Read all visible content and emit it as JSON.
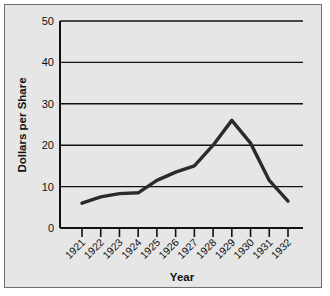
{
  "chart_data": {
    "type": "line",
    "title": "",
    "xlabel": "Year",
    "ylabel": "Dollars per Share",
    "categories": [
      "1921",
      "1922",
      "1923",
      "1924",
      "1925",
      "1926",
      "1927",
      "1928",
      "1929",
      "1930",
      "1931",
      "1932"
    ],
    "values": [
      6,
      7.5,
      8.3,
      8.5,
      11.5,
      13.5,
      15,
      20,
      26,
      20.5,
      11.5,
      6.5
    ],
    "series": [
      {
        "name": "Dollars per Share",
        "values": [
          6,
          7.5,
          8.3,
          8.5,
          11.5,
          13.5,
          15,
          20,
          26,
          20.5,
          11.5,
          6.5
        ]
      }
    ],
    "ylim": [
      0,
      50
    ],
    "yticks": [
      0,
      10,
      20,
      30,
      40,
      50
    ],
    "ytick_labels": [
      "0",
      "10",
      "20",
      "30",
      "40",
      "50"
    ],
    "xtick_labels": [
      "1921",
      "1922",
      "1923",
      "1924",
      "1925",
      "1926",
      "1927",
      "1928",
      "1929",
      "1930",
      "1931",
      "1932"
    ],
    "grid": true,
    "grid_axis": "y",
    "legend": false,
    "legend_position": "none",
    "line_color": "#2b2b2b",
    "background_color": "#e6e6e6",
    "axis_color": "#111111",
    "xlabel_rotation": -45
  },
  "figure": {
    "border_color": "#6e6e6e",
    "page_background": "#ffffff"
  }
}
